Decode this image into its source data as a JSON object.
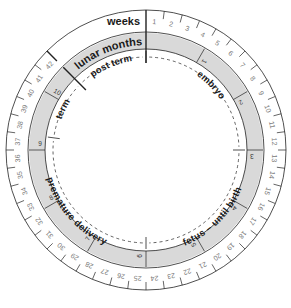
{
  "diagram": {
    "title_weeks": "weeks",
    "title_months": "lunar months",
    "geometry": {
      "cx": 146,
      "cy": 150,
      "r_outer": 140,
      "r_week_inner": 118,
      "r_band_outer": 117,
      "r_band_inner": 101,
      "deg_per_week": 7.5
    },
    "colors": {
      "line": "#222222",
      "band": "#d9d9d9",
      "week_text": "#777777",
      "label": "#1a1a1a"
    },
    "weeks": [
      1,
      2,
      3,
      4,
      5,
      6,
      7,
      8,
      9,
      10,
      11,
      12,
      13,
      14,
      15,
      16,
      17,
      18,
      19,
      20,
      21,
      22,
      23,
      24,
      25,
      26,
      27,
      28,
      29,
      30,
      31,
      32,
      33,
      34,
      35,
      36,
      37,
      38,
      39,
      40,
      41,
      42
    ],
    "lunar_months": [
      1,
      2,
      3,
      4,
      5,
      6,
      7,
      8,
      9,
      10
    ],
    "phases": [
      {
        "name": "embryo",
        "label": "embryo",
        "start_week": 0,
        "end_week": 12
      },
      {
        "name": "fetus-until-birth",
        "label": "fetus – until birth",
        "start_week": 12,
        "end_week": 24
      },
      {
        "name": "premature-delivery",
        "label": "premature delivery",
        "start_week": 24,
        "end_week": 37
      },
      {
        "name": "term",
        "label": "term",
        "start_week": 37,
        "end_week": 42
      },
      {
        "name": "post-term",
        "label": "post term",
        "start_week": 42,
        "end_week": 48
      }
    ]
  }
}
